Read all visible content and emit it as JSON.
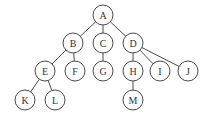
{
  "diagram": {
    "type": "tree",
    "node_radius": 10,
    "nodes": [
      {
        "id": "A",
        "label": "A",
        "x": 103,
        "y": 15
      },
      {
        "id": "B",
        "label": "B",
        "x": 73,
        "y": 43
      },
      {
        "id": "C",
        "label": "C",
        "x": 103,
        "y": 43
      },
      {
        "id": "D",
        "label": "D",
        "x": 133,
        "y": 43
      },
      {
        "id": "E",
        "label": "E",
        "x": 45,
        "y": 71
      },
      {
        "id": "F",
        "label": "F",
        "x": 75,
        "y": 71
      },
      {
        "id": "G",
        "label": "G",
        "x": 103,
        "y": 71
      },
      {
        "id": "H",
        "label": "H",
        "x": 133,
        "y": 71
      },
      {
        "id": "I",
        "label": "I",
        "x": 160,
        "y": 71
      },
      {
        "id": "J",
        "label": "J",
        "x": 188,
        "y": 71
      },
      {
        "id": "K",
        "label": "K",
        "x": 25,
        "y": 100
      },
      {
        "id": "L",
        "label": "L",
        "x": 55,
        "y": 100
      },
      {
        "id": "M",
        "label": "M",
        "x": 133,
        "y": 100
      }
    ],
    "edges": [
      [
        "A",
        "B"
      ],
      [
        "A",
        "C"
      ],
      [
        "A",
        "D"
      ],
      [
        "B",
        "E"
      ],
      [
        "B",
        "F"
      ],
      [
        "C",
        "G"
      ],
      [
        "D",
        "H"
      ],
      [
        "D",
        "I"
      ],
      [
        "D",
        "J"
      ],
      [
        "E",
        "K"
      ],
      [
        "E",
        "L"
      ],
      [
        "H",
        "M"
      ]
    ]
  }
}
